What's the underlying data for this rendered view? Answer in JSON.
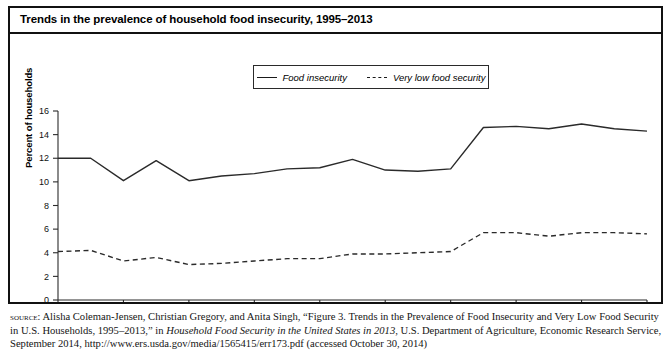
{
  "figure": {
    "title": "Trends in the prevalence of household food insecurity, 1995–2013"
  },
  "legend": {
    "position": "top-center",
    "entries": [
      {
        "label": "Food insecurity",
        "style": "solid"
      },
      {
        "label": "Very low food security",
        "style": "dashed"
      }
    ]
  },
  "axes": {
    "ylabel": "Percent of households",
    "xlabel": "",
    "yticks": [
      "0",
      "2",
      "4",
      "6",
      "8",
      "10",
      "12",
      "14",
      "16"
    ],
    "xticks": [
      "1995",
      "1997",
      "1999",
      "2001",
      "2003",
      "2005",
      "2007",
      "2009",
      "2011",
      "2013"
    ]
  },
  "source": {
    "prefix": "source:",
    "line1_a": " Alisha Coleman-Jensen, Christian Gregory, and Anita Singh, “Figure 3. Trends in the Prevalence of Food Insecurity and Very Low Food Security in U.S. Households, 1995–2013,” in ",
    "italic1": "Household Food Security in the United States in 2013",
    "line1_b": ", U.S. Department of Agriculture, Economic Research Service, September 2014, http://www.ers.usda.gov/media/1565415/err173.pdf (accessed October 30, 2014)"
  },
  "chart_data": {
    "type": "line",
    "title": "Trends in the prevalence of household food insecurity, 1995–2013",
    "xlabel": "",
    "ylabel": "Percent of households",
    "xlim": [
      1995,
      2013
    ],
    "ylim": [
      0,
      16
    ],
    "grid": false,
    "legend_position": "top-center",
    "x": [
      1995,
      1996,
      1997,
      1998,
      1999,
      2000,
      2001,
      2002,
      2003,
      2004,
      2005,
      2006,
      2007,
      2008,
      2009,
      2010,
      2011,
      2012,
      2013
    ],
    "series": [
      {
        "name": "Food insecurity",
        "style": "solid",
        "color": "#2a2a2a",
        "values": [
          12.0,
          12.0,
          10.1,
          11.8,
          10.1,
          10.5,
          10.7,
          11.1,
          11.2,
          11.9,
          11.0,
          10.9,
          11.1,
          14.6,
          14.7,
          14.5,
          14.9,
          14.5,
          14.3
        ]
      },
      {
        "name": "Very low food security",
        "style": "dashed",
        "color": "#2a2a2a",
        "values": [
          4.1,
          4.2,
          3.3,
          3.6,
          3.0,
          3.1,
          3.3,
          3.5,
          3.5,
          3.9,
          3.9,
          4.0,
          4.1,
          5.7,
          5.7,
          5.4,
          5.7,
          5.7,
          5.6
        ]
      }
    ]
  }
}
